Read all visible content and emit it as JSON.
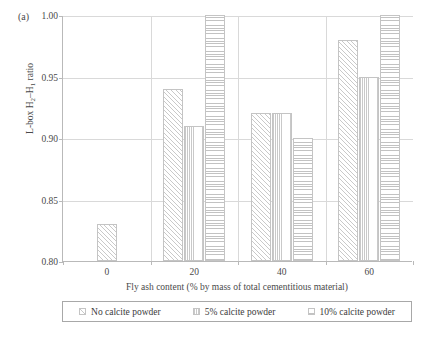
{
  "panel_label": "(a)",
  "chart_data": {
    "type": "bar",
    "title": "",
    "subtitle": "",
    "xlabel": "Fly ash content (% by mass of total cementitious material)",
    "ylabel": "L-box H₂–H₁ ratio",
    "ylabel_parts": {
      "prefix": "L-box H",
      "sub1": "2",
      "mid": "–H",
      "sub2": "1",
      "suffix": " ratio"
    },
    "categories": [
      "0",
      "20",
      "40",
      "60"
    ],
    "ylim": [
      0.8,
      1.0
    ],
    "ytick_labels": [
      "0.80",
      "0.85",
      "0.90",
      "0.95",
      "1.00"
    ],
    "ytick_values": [
      0.8,
      0.85,
      0.9,
      0.95,
      1.0
    ],
    "grid": true,
    "legend_position": "below",
    "series": [
      {
        "name": "No calcite powder",
        "pattern": "diagonal-hatch",
        "values": [
          0.83,
          0.94,
          0.92,
          0.98
        ]
      },
      {
        "name": "5% calcite powder",
        "pattern": "vertical-lines",
        "values": [
          null,
          0.91,
          0.92,
          0.95
        ]
      },
      {
        "name": "10% calcite powder",
        "pattern": "horizontal-lines",
        "values": [
          null,
          1.0,
          0.9,
          1.0
        ]
      }
    ]
  },
  "colors": {
    "axis": "#b9b9b9",
    "grid": "#d9d9d9",
    "text": "#4a4a4a",
    "bar_edge": "#c4c4c4",
    "bar_hatch": "#c9c9c9",
    "legend_border": "#a8a8a8",
    "background": "#ffffff"
  }
}
